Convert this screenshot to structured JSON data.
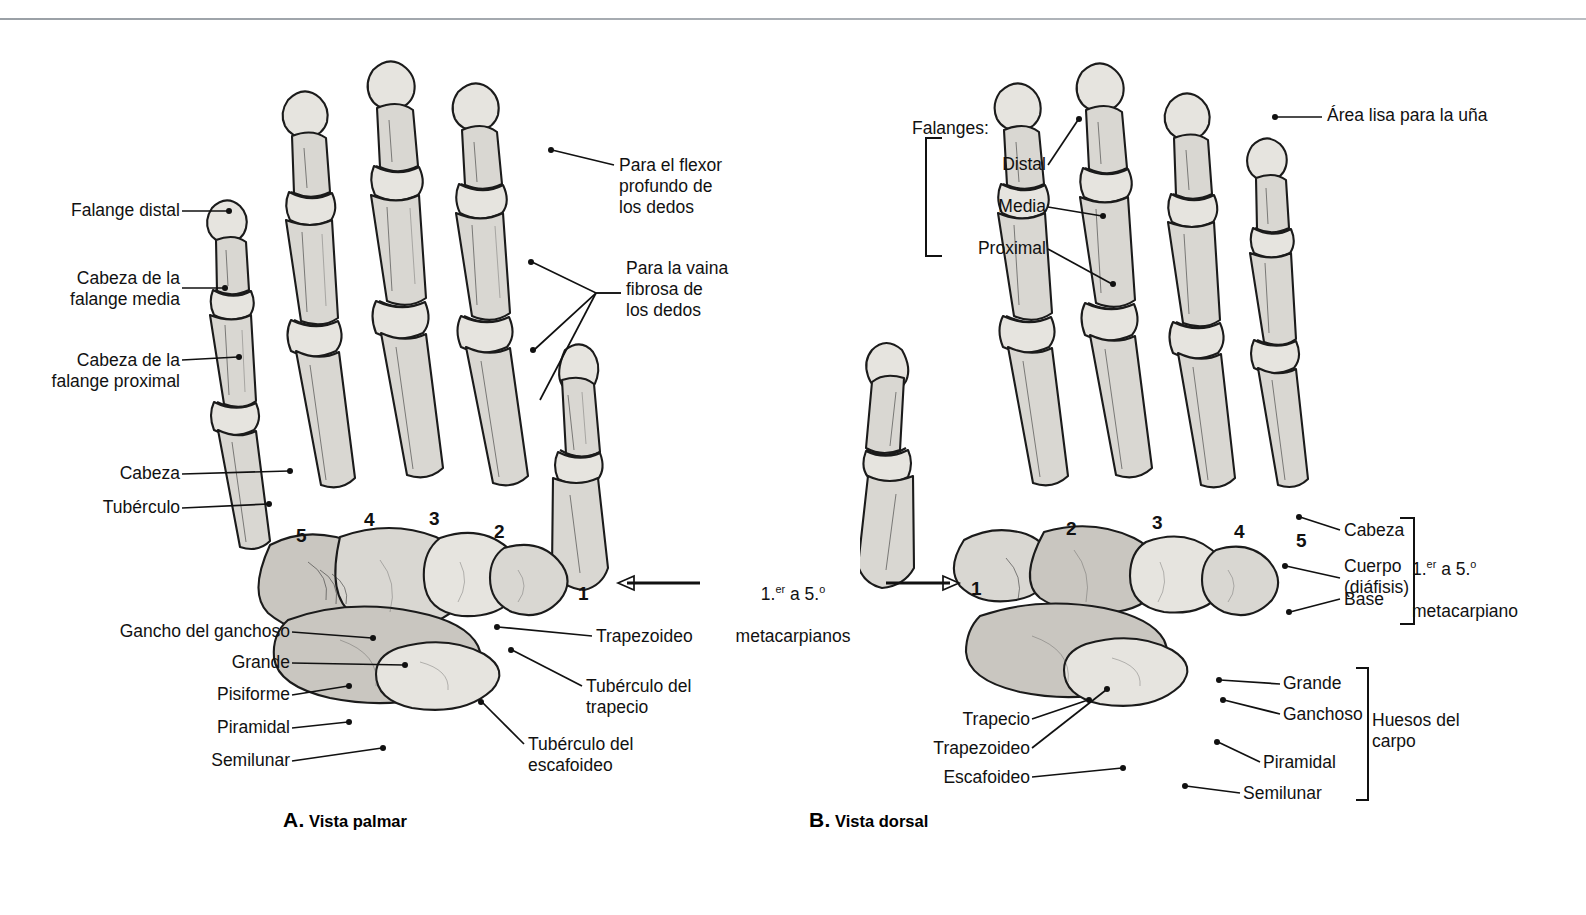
{
  "figure": {
    "top_cut_text": "",
    "panels": [
      {
        "id": "A",
        "letter": "A.",
        "caption": "Vista palmar",
        "metacarpal_numbers": [
          "5",
          "4",
          "3",
          "2",
          "1"
        ],
        "center_callout": {
          "line1_pre": "1.",
          "line1_sup1": "er",
          "line1_mid": " a 5.",
          "line1_sup2": "o",
          "line2": "metacarpianos"
        },
        "labels": [
          {
            "name": "falange-distal",
            "text": "Falange distal"
          },
          {
            "name": "cabeza-falange-media",
            "text": "Cabeza de la\nfalange media"
          },
          {
            "name": "cabeza-falange-proximal",
            "text": "Cabeza de la\nfalange proximal"
          },
          {
            "name": "cabeza",
            "text": "Cabeza"
          },
          {
            "name": "tuberculo",
            "text": "Tubérculo"
          },
          {
            "name": "gancho-del-ganchoso",
            "text": "Gancho del ganchoso"
          },
          {
            "name": "grande",
            "text": "Grande"
          },
          {
            "name": "pisiforme",
            "text": "Pisiforme"
          },
          {
            "name": "piramidal",
            "text": "Piramidal"
          },
          {
            "name": "semilunar",
            "text": "Semilunar"
          },
          {
            "name": "flexor-profundo",
            "text": "Para el flexor\nprofundo de\nlos dedos"
          },
          {
            "name": "vaina-fibrosa",
            "text": "Para la vaina\nfibrosa de\nlos dedos"
          },
          {
            "name": "trapezoideo",
            "text": "Trapezoideo"
          },
          {
            "name": "tuberculo-del-trapecio",
            "text": "Tubérculo del\ntrapecio"
          },
          {
            "name": "tuberculo-del-escafoideo",
            "text": "Tubérculo del\nescafoideo"
          }
        ]
      },
      {
        "id": "B",
        "letter": "B.",
        "caption": "Vista dorsal",
        "metacarpal_numbers": [
          "1",
          "2",
          "3",
          "4",
          "5"
        ],
        "labels": [
          {
            "name": "falanges-group",
            "text": "Falanges:"
          },
          {
            "name": "falange-distal",
            "text": "Distal"
          },
          {
            "name": "falange-media",
            "text": "Media"
          },
          {
            "name": "falange-proximal",
            "text": "Proximal"
          },
          {
            "name": "area-lisa-una",
            "text": "Área lisa para la uña"
          },
          {
            "name": "cabeza",
            "text": "Cabeza"
          },
          {
            "name": "cuerpo-diafisis",
            "text": "Cuerpo\n(diáfisis)"
          },
          {
            "name": "base",
            "text": "Base"
          },
          {
            "name": "trapecio",
            "text": "Trapecio"
          },
          {
            "name": "trapezoideo",
            "text": "Trapezoideo"
          },
          {
            "name": "escafoideo",
            "text": "Escafoideo"
          },
          {
            "name": "grande",
            "text": "Grande"
          },
          {
            "name": "ganchoso",
            "text": "Ganchoso"
          },
          {
            "name": "piramidal",
            "text": "Piramidal"
          },
          {
            "name": "semilunar",
            "text": "Semilunar"
          }
        ],
        "bracket_metacarpiano": {
          "line1_pre": "1.",
          "line1_sup1": "er",
          "line1_mid": " a 5.",
          "line1_sup2": "o",
          "line2": "metacarpiano"
        },
        "bracket_carpo": "Huesos del\ncarpo"
      }
    ]
  },
  "colors": {
    "bone_fill": "#d9d7d2",
    "bone_outline": "#1b1b1b",
    "text": "#111111",
    "rule": "#9aa0a6"
  }
}
